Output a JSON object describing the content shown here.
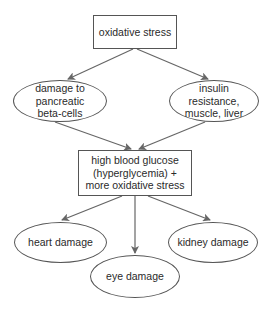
{
  "diagram": {
    "type": "flowchart",
    "nodes": {
      "oxidative_stress": {
        "label": "oxidative stress",
        "shape": "rectangle"
      },
      "beta_cells": {
        "label": "damage to pancreatic beta-cells",
        "lines": [
          "damage to",
          "pancreatic",
          "beta-cells"
        ],
        "shape": "ellipse"
      },
      "insulin_resistance": {
        "label": "insulin resistance, muscle, liver",
        "lines": [
          "insulin",
          "resistance,",
          "muscle, liver"
        ],
        "shape": "ellipse"
      },
      "hyperglycemia": {
        "label": "high blood glucose (hyperglycemia) + more oxidative stress",
        "lines": [
          "high blood glucose",
          "(hyperglycemia) +",
          "more oxidative stress"
        ],
        "shape": "rectangle"
      },
      "heart": {
        "label": "heart damage",
        "shape": "ellipse"
      },
      "eye": {
        "label": "eye damage",
        "shape": "ellipse"
      },
      "kidney": {
        "label": "kidney damage",
        "shape": "ellipse"
      }
    },
    "edges": [
      {
        "from": "oxidative_stress",
        "to": "beta_cells"
      },
      {
        "from": "oxidative_stress",
        "to": "insulin_resistance"
      },
      {
        "from": "beta_cells",
        "to": "hyperglycemia"
      },
      {
        "from": "insulin_resistance",
        "to": "hyperglycemia"
      },
      {
        "from": "hyperglycemia",
        "to": "heart"
      },
      {
        "from": "hyperglycemia",
        "to": "eye"
      },
      {
        "from": "hyperglycemia",
        "to": "kidney"
      }
    ],
    "colors": {
      "stroke": "#555555",
      "arrow": "#666666",
      "text": "#2a2a2a",
      "background": "#ffffff"
    }
  }
}
